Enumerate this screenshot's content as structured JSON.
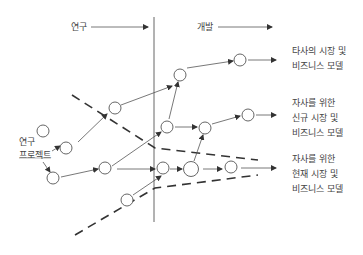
{
  "phases": {
    "research": "연구",
    "development": "개발"
  },
  "source_label": [
    "연구",
    "프로젝트"
  ],
  "outcomes": [
    {
      "lines": [
        "타사의 시장 및",
        "비즈니스 모델"
      ]
    },
    {
      "lines": [
        "자사를 위한",
        "신규 시장 및",
        "비즈니스 모델"
      ]
    },
    {
      "lines": [
        "자사를 위한",
        "현재 시장 및",
        "비즈니스 모델"
      ]
    }
  ],
  "colors": {
    "line": "#555555",
    "text": "#444444",
    "background": "#ffffff"
  }
}
